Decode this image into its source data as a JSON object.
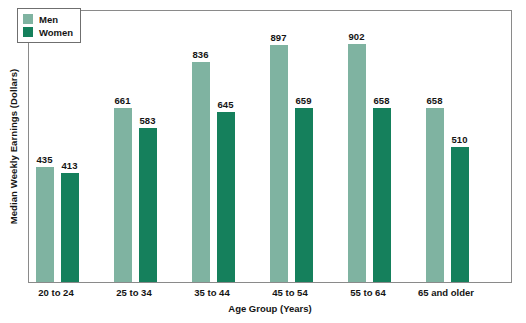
{
  "chart_data": {
    "type": "bar",
    "title": "",
    "xlabel": "Age Group (Years)",
    "ylabel": "Median Weekly Earnings (Dollars)",
    "categories": [
      "20 to 24",
      "25 to 34",
      "35 to 44",
      "45 to 54",
      "55 to 64",
      "65 and older"
    ],
    "series": [
      {
        "name": "Men",
        "color": "#7fb3a1",
        "values": [
          435,
          661,
          836,
          897,
          902,
          658
        ]
      },
      {
        "name": "Women",
        "color": "#15805c",
        "values": [
          413,
          583,
          645,
          659,
          658,
          510
        ]
      }
    ],
    "ylim": [
      0,
      1035
    ],
    "yticks": [],
    "grid": false,
    "legend_position": "top-left",
    "data_labels": true
  },
  "legend": {
    "items": [
      {
        "label": "Men"
      },
      {
        "label": "Women"
      }
    ]
  },
  "axes": {
    "x_title": "Age Group (Years)",
    "y_title": "Median Weekly Earnings (Dollars)"
  }
}
